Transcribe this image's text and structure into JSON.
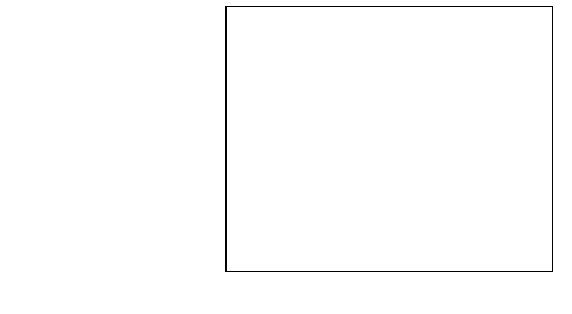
{
  "chart_data": {
    "type": "bar",
    "orientation": "horizontal",
    "title": "",
    "subtitle": "",
    "xlabel": "Percent",
    "ylabel": "",
    "xlim": [
      0.0,
      80.0
    ],
    "xtick_step": 10.0,
    "xticks": [
      "0.0",
      "10.0",
      "20.0",
      "30.0",
      "40.0",
      "50.0",
      "60.0",
      "70.0",
      "80.0"
    ],
    "grid": "vertical",
    "legend": "none",
    "categories": [
      "Non-Hispanic Black",
      "Black",
      "American Indian and Alaska Native",
      "Hispanic (of any race)",
      "All races and origins",
      "White",
      "Non-Hispanic White",
      "Asian or Pacific Islander"
    ],
    "values": [
      71.0,
      70.8,
      66.0,
      52.5,
      40.0,
      36.0,
      30.5,
      0.0
    ],
    "bar_colors": [
      "#808080",
      "#808080",
      "#808080",
      "#808080",
      "#000000",
      "#808080",
      "#808080",
      "#808080"
    ],
    "highlight_category": "All races and origins"
  },
  "colors": {
    "bar_gray": "#808080",
    "bar_highlight": "#000000",
    "axis": "#000000",
    "background": "#ffffff"
  }
}
